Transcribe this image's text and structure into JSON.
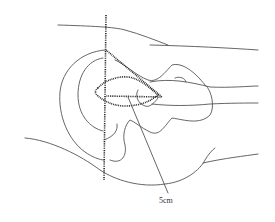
{
  "diagram": {
    "type": "anatomical line drawing",
    "labels": {
      "measurement": "5cm"
    },
    "colors": {
      "line": "#555555",
      "dotted": "#222222",
      "background": "#ffffff"
    }
  }
}
